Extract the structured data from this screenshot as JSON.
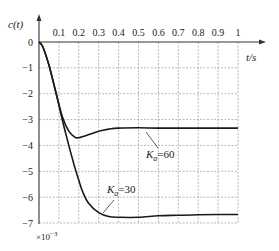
{
  "chart_data": {
    "type": "line",
    "title": "",
    "xlabel": "t/s",
    "ylabel": "c(t)",
    "y_scale_note": "×10^-3",
    "xlim": [
      0,
      1
    ],
    "ylim": [
      -7,
      0
    ],
    "grid": true,
    "x_ticks": [
      "0.1",
      "0.2",
      "0.3",
      "0.4",
      "0.5",
      "0.6",
      "0.7",
      "0.8",
      "0.9",
      "1"
    ],
    "y_ticks": [
      "0",
      "-1",
      "-2",
      "-3",
      "-4",
      "-5",
      "-6",
      "-7"
    ],
    "series": [
      {
        "name": "Ka=60",
        "label_main": "K",
        "label_sub": "a",
        "label_rest": "=60",
        "x": [
          0,
          0.02,
          0.05,
          0.08,
          0.1,
          0.12,
          0.15,
          0.18,
          0.2,
          0.22,
          0.25,
          0.3,
          0.35,
          0.4,
          0.5,
          0.6,
          0.7,
          0.8,
          0.9,
          1.0
        ],
        "values": [
          0,
          -0.2,
          -0.9,
          -1.8,
          -2.4,
          -2.95,
          -3.45,
          -3.68,
          -3.7,
          -3.66,
          -3.58,
          -3.45,
          -3.37,
          -3.33,
          -3.32,
          -3.33,
          -3.33,
          -3.33,
          -3.33,
          -3.33
        ]
      },
      {
        "name": "Ka=30",
        "label_main": "K",
        "label_sub": "a",
        "label_rest": "=30",
        "x": [
          0,
          0.02,
          0.05,
          0.08,
          0.1,
          0.12,
          0.15,
          0.18,
          0.2,
          0.22,
          0.25,
          0.3,
          0.35,
          0.4,
          0.5,
          0.6,
          0.7,
          0.8,
          0.9,
          1.0
        ],
        "values": [
          0,
          -0.2,
          -0.9,
          -1.8,
          -2.45,
          -3.1,
          -4.0,
          -4.85,
          -5.35,
          -5.8,
          -6.25,
          -6.6,
          -6.75,
          -6.78,
          -6.78,
          -6.72,
          -6.7,
          -6.68,
          -6.67,
          -6.67
        ]
      }
    ]
  },
  "labels": {
    "ylabel": "c(t)",
    "xlabel": "t/s",
    "scale_note": "×10",
    "scale_exp": "−3",
    "ka60_main": "K",
    "ka60_sub": "a",
    "ka60_rest": "=60",
    "ka30_main": "K",
    "ka30_sub": "a",
    "ka30_rest": "=30"
  }
}
